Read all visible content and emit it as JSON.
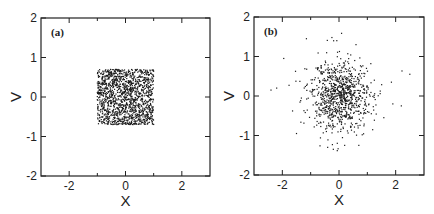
{
  "chart_data": [
    {
      "type": "scatter",
      "panel_label": "(a)",
      "title": "",
      "xlabel": "x",
      "ylabel": "v",
      "xlim": [
        -3,
        3
      ],
      "ylim": [
        -2,
        2
      ],
      "xticks": [
        -2,
        0,
        2
      ],
      "xtick_labels": [
        "-2",
        "0",
        "2"
      ],
      "xminor_ticks": [
        -1,
        1
      ],
      "yticks": [
        -2,
        -1,
        0,
        1,
        2
      ],
      "ytick_labels": [
        "-2",
        "-1",
        "0",
        "1",
        "2"
      ],
      "grid": false,
      "legend": null,
      "distribution": {
        "kind": "uniform-square",
        "x_range": [
          -1.0,
          1.0
        ],
        "v_range": [
          -0.7,
          0.7
        ],
        "n_points": 1400
      },
      "marker_color": "#1a1a1a"
    },
    {
      "type": "scatter",
      "panel_label": "(b)",
      "title": "",
      "xlabel": "x",
      "ylabel": "v",
      "xlim": [
        -3,
        3
      ],
      "ylim": [
        -2,
        2
      ],
      "xticks": [
        -2,
        0,
        2
      ],
      "xtick_labels": [
        "-2",
        "0",
        "2"
      ],
      "xminor_ticks": [
        -1,
        1
      ],
      "yticks": [
        -2,
        -1,
        0,
        1,
        2
      ],
      "ytick_labels": [
        "-2",
        "-1",
        "0",
        "1",
        "2"
      ],
      "grid": false,
      "legend": null,
      "distribution": {
        "kind": "gaussian-cloud",
        "center": [
          0.0,
          0.0
        ],
        "sigma_x": 0.55,
        "sigma_v": 0.45,
        "n_points": 900,
        "outliers": [
          [
            -2.4,
            0.15
          ],
          [
            -2.2,
            0.2
          ],
          [
            -1.95,
            0.95
          ],
          [
            -1.15,
            1.45
          ],
          [
            -0.25,
            1.48
          ],
          [
            0.6,
            1.3
          ],
          [
            2.5,
            0.55
          ],
          [
            2.2,
            -0.25
          ],
          [
            1.85,
            0.35
          ],
          [
            1.9,
            -0.2
          ],
          [
            -0.4,
            -1.3
          ],
          [
            -0.2,
            -1.35
          ],
          [
            0.2,
            -1.25
          ],
          [
            0.7,
            -1.25
          ],
          [
            -1.5,
            -0.95
          ]
        ]
      },
      "marker_color": "#1a1a1a"
    }
  ]
}
